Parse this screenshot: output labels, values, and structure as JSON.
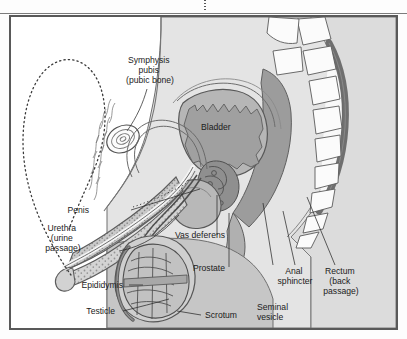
{
  "figure": {
    "crop_mark": "page-crop-mark",
    "palette": {
      "page_background": "#ffffff",
      "frame_border": "#595959",
      "body_fill": "#e2e2e2",
      "body_mid": "#cfcfcf",
      "organ_dark": "#9e9e9e",
      "organ_darker": "#8a8a8a",
      "bladder_fill": "#b4b4b4",
      "bone_fill": "#fbfbfb",
      "outline": "#4a4a4a",
      "text": "#1b1b1b",
      "leader": "#2b2b2b"
    }
  },
  "labels": [
    {
      "id": "symphysis-pubis",
      "lines": [
        "Symphysis",
        "pubis",
        "(pubic bone)"
      ],
      "align": "center"
    },
    {
      "id": "bladder",
      "lines": [
        "Bladder"
      ],
      "align": "start"
    },
    {
      "id": "penis",
      "lines": [
        "Penis"
      ],
      "align": "end"
    },
    {
      "id": "urethra",
      "lines": [
        "Urethra",
        "(urine",
        "passage)"
      ],
      "align": "center"
    },
    {
      "id": "epididymis",
      "lines": [
        "Epididymis"
      ],
      "align": "end"
    },
    {
      "id": "testicle",
      "lines": [
        "Testicle"
      ],
      "align": "end"
    },
    {
      "id": "vas-deferens",
      "lines": [
        "Vas deferens"
      ],
      "align": "start"
    },
    {
      "id": "prostate",
      "lines": [
        "Prostate"
      ],
      "align": "start"
    },
    {
      "id": "scrotum",
      "lines": [
        "Scrotum"
      ],
      "align": "start"
    },
    {
      "id": "seminal-vesicle",
      "lines": [
        "Seminal",
        "vesicle"
      ],
      "align": "start"
    },
    {
      "id": "anal-sphincter",
      "lines": [
        "Anal",
        "sphincter"
      ],
      "align": "center"
    },
    {
      "id": "rectum",
      "lines": [
        "Rectum",
        "(back",
        "passage)"
      ],
      "align": "center"
    }
  ],
  "structures": [
    "abdominal-wall",
    "pubic-bone",
    "bladder",
    "urethra",
    "penis-shaft",
    "glans",
    "erect-penis-outline-dotted",
    "epididymis",
    "testicle",
    "scrotum",
    "vas-deferens",
    "prostate",
    "seminal-vesicle",
    "rectum",
    "anal-sphincter",
    "sacrum",
    "vertebrae",
    "spinal-canal",
    "pubic-hair"
  ],
  "vertebrae_count": 8
}
